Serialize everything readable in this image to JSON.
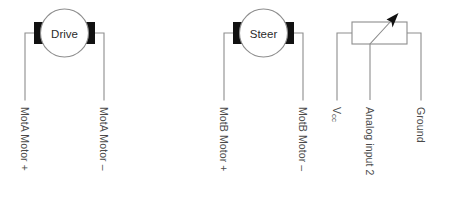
{
  "diagram": {
    "colors": {
      "wire": "#8d8d8d",
      "terminal": "#111111",
      "text": "#4a4a4a",
      "background": "#ffffff"
    },
    "components": [
      {
        "id": "drive-motor",
        "type": "motor",
        "label": "Drive",
        "terminals": [
          "left",
          "right"
        ]
      },
      {
        "id": "steer-motor",
        "type": "motor",
        "label": "Steer",
        "terminals": [
          "left",
          "right"
        ]
      },
      {
        "id": "potentiometer",
        "type": "potentiometer",
        "label": "",
        "terminals": [
          "left",
          "wiper",
          "right"
        ]
      }
    ],
    "pins": [
      {
        "id": "pin-mota-plus",
        "label": "MotA Motor +",
        "x": 25,
        "component": "drive-motor"
      },
      {
        "id": "pin-mota-minus",
        "label": "MotA Motor –",
        "x": 104,
        "component": "drive-motor"
      },
      {
        "id": "pin-motb-plus",
        "label": "MotB Motor +",
        "x": 224,
        "component": "steer-motor"
      },
      {
        "id": "pin-motb-minus",
        "label": "MotB Motor –",
        "x": 303,
        "component": "steer-motor"
      },
      {
        "id": "pin-vcc",
        "label": "Vcc",
        "label_main": "V",
        "label_sub": "cc",
        "x": 337,
        "component": "potentiometer"
      },
      {
        "id": "pin-analog-in-2",
        "label": "Analog input 2",
        "x": 370,
        "component": "potentiometer"
      },
      {
        "id": "pin-ground",
        "label": "Ground",
        "x": 421,
        "component": "potentiometer"
      }
    ]
  }
}
